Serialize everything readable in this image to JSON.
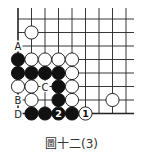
{
  "diagram": {
    "caption": "圖十二(3)",
    "columns": 9,
    "rows": 8,
    "stones": [
      {
        "color": "white",
        "col": 1,
        "row": 1
      },
      {
        "color": "black",
        "col": 0,
        "row": 3
      },
      {
        "color": "white",
        "col": 1,
        "row": 3
      },
      {
        "color": "white",
        "col": 2,
        "row": 3
      },
      {
        "color": "white",
        "col": 3,
        "row": 3
      },
      {
        "color": "white",
        "col": 4,
        "row": 3
      },
      {
        "color": "black",
        "col": 0,
        "row": 4
      },
      {
        "color": "black",
        "col": 1,
        "row": 4
      },
      {
        "color": "black",
        "col": 2,
        "row": 4
      },
      {
        "color": "black",
        "col": 3,
        "row": 4
      },
      {
        "color": "white",
        "col": 4,
        "row": 4
      },
      {
        "color": "white",
        "col": 0,
        "row": 5
      },
      {
        "color": "white",
        "col": 1,
        "row": 5
      },
      {
        "color": "black",
        "col": 3,
        "row": 5
      },
      {
        "color": "white",
        "col": 4,
        "row": 5
      },
      {
        "color": "white",
        "col": 1,
        "row": 6
      },
      {
        "color": "black",
        "col": 3,
        "row": 6
      },
      {
        "color": "white",
        "col": 4,
        "row": 6
      },
      {
        "color": "white",
        "col": 7,
        "row": 6
      },
      {
        "color": "black",
        "col": 1,
        "row": 7
      },
      {
        "color": "black",
        "col": 2,
        "row": 7
      },
      {
        "color": "black",
        "col": 3,
        "row": 7,
        "number": "2"
      },
      {
        "color": "black",
        "col": 4,
        "row": 7
      },
      {
        "color": "white",
        "col": 5,
        "row": 7,
        "number": "1"
      }
    ],
    "labels": [
      {
        "text": "A",
        "col": 0,
        "row": 2
      },
      {
        "text": "C",
        "col": 2,
        "row": 5
      },
      {
        "text": "B",
        "col": 0,
        "row": 6
      },
      {
        "text": "D",
        "col": 0,
        "row": 7
      }
    ]
  }
}
